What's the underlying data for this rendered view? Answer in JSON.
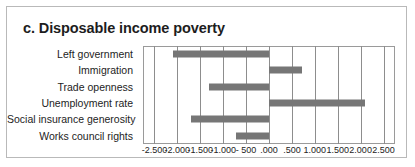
{
  "figure": {
    "title": "c. Disposable income poverty"
  },
  "chart_data": {
    "type": "bar",
    "orientation": "horizontal",
    "title": "c. Disposable income poverty",
    "xlabel": "",
    "ylabel": "",
    "categories": [
      "Left government",
      "Immigration",
      "Trade openness",
      "Unemployment rate",
      "Social insurance generosity",
      "Works council rights"
    ],
    "values": [
      -2.1,
      0.72,
      -1.3,
      2.09,
      -1.7,
      -0.73
    ],
    "xlim": [
      -2.75,
      2.75
    ],
    "xticks": [
      -2.5,
      -2.0,
      -1.5,
      -1.0,
      -0.5,
      0.0,
      0.5,
      1.0,
      1.5,
      2.0,
      2.5
    ],
    "xticklabels": [
      "-2.500",
      "-2.000",
      "-1.500",
      "-1.000",
      "- 500",
      ".000",
      ".500",
      "1.000",
      "1.500",
      "2.000",
      "2.500"
    ],
    "grid": true,
    "grid_axis": "x",
    "legend": false,
    "bar_color": "#767676",
    "gridline_color": "#8d8d8d",
    "axis_color": "#9a9a9a"
  }
}
